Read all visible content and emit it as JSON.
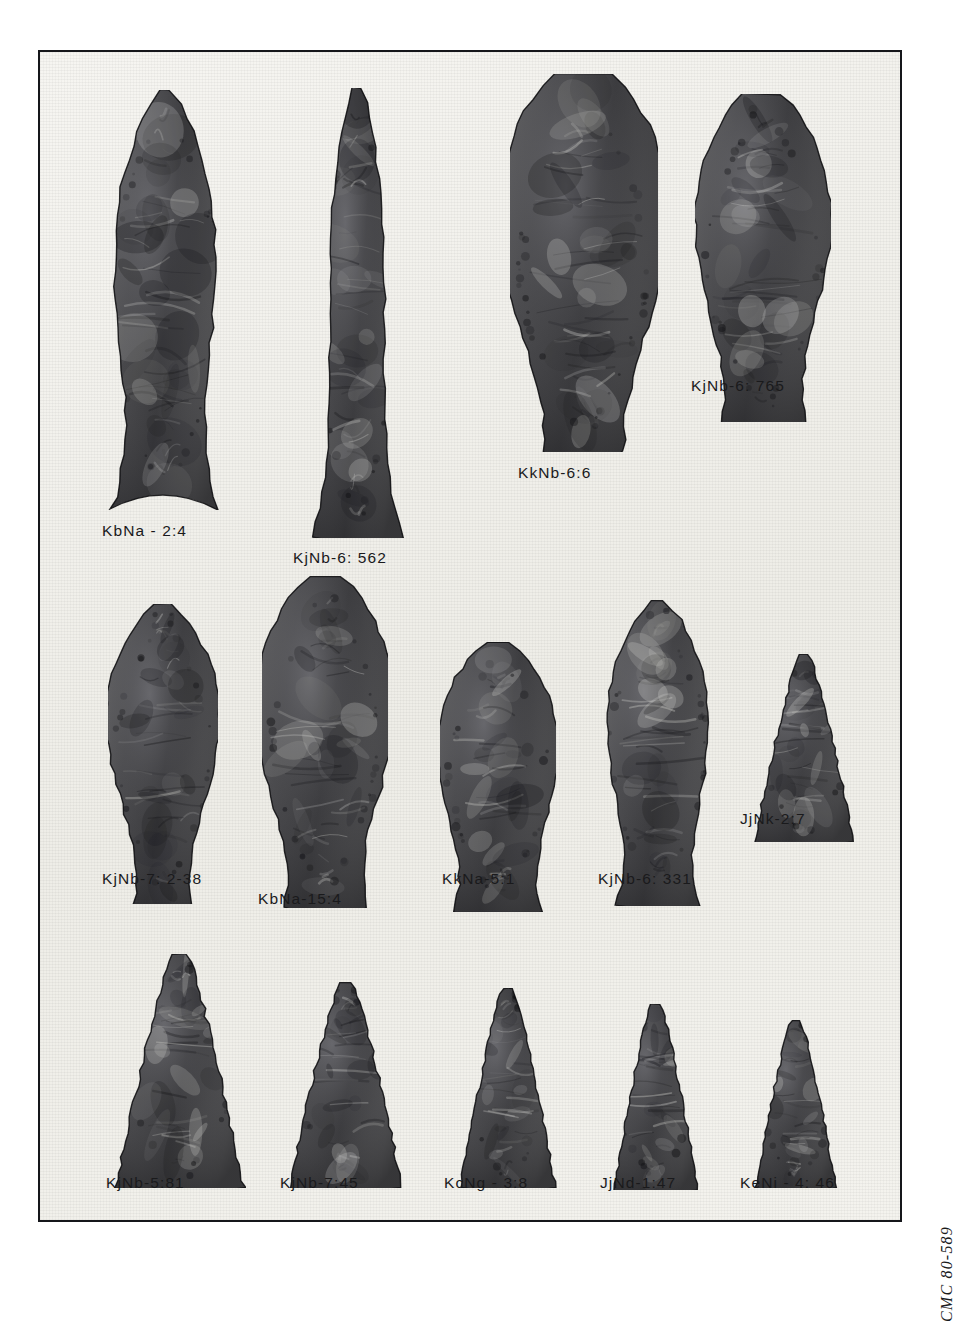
{
  "plate": {
    "archive_caption": "CMC 80-589",
    "background_color": "#f2f1ec",
    "frame_color": "#15161a",
    "stone_color": "#4a4a4c"
  },
  "rows": [
    {
      "row_label": "row-1",
      "specimens": [
        {
          "catalog": "KbNa - 2:4",
          "shape": "long-lanceolate-concave-base",
          "x": 58,
          "y": 38,
          "w": 134,
          "h": 420,
          "cap_x": 62,
          "cap_y": 470
        },
        {
          "catalog": "KjNb-6: 562",
          "shape": "narrow-parallel-lanceolate",
          "x": 268,
          "y": 36,
          "w": 98,
          "h": 450,
          "cap_x": 253,
          "cap_y": 497
        },
        {
          "catalog": "KkNb-6:6",
          "shape": "broad-ovoid-biface",
          "x": 470,
          "y": 22,
          "w": 148,
          "h": 378,
          "cap_x": 478,
          "cap_y": 412
        },
        {
          "catalog": "KjNb-6: 765",
          "shape": "ovate-rounded-base",
          "x": 655,
          "y": 42,
          "w": 136,
          "h": 328,
          "cap_x": 651,
          "cap_y": 325
        }
      ]
    },
    {
      "row_label": "row-2",
      "specimens": [
        {
          "catalog": "KjNb-7: 2-38",
          "shape": "leaf-biconvex",
          "x": 68,
          "y": 552,
          "w": 110,
          "h": 300,
          "cap_x": 62,
          "cap_y": 818
        },
        {
          "catalog": "KbNa-15:4",
          "shape": "broad-leaf-flat-base",
          "x": 222,
          "y": 524,
          "w": 126,
          "h": 332,
          "cap_x": 218,
          "cap_y": 838
        },
        {
          "catalog": "KkNa-5:1",
          "shape": "ovate-blunt-base",
          "x": 400,
          "y": 590,
          "w": 116,
          "h": 270,
          "cap_x": 402,
          "cap_y": 818
        },
        {
          "catalog": "KjNb-6: 331",
          "shape": "lanceolate-pointed",
          "x": 560,
          "y": 548,
          "w": 116,
          "h": 306,
          "cap_x": 558,
          "cap_y": 818
        },
        {
          "catalog": "JjNk-2:7",
          "shape": "small-triangular",
          "x": 712,
          "y": 602,
          "w": 104,
          "h": 188,
          "cap_x": 700,
          "cap_y": 758
        }
      ]
    },
    {
      "row_label": "row-3",
      "specimens": [
        {
          "catalog": "KjNb-5:81",
          "shape": "triangular-straight-base",
          "x": 74,
          "y": 902,
          "w": 132,
          "h": 234,
          "cap_x": 66,
          "cap_y": 1122
        },
        {
          "catalog": "KjNb-7:45",
          "shape": "triangular-straight-base",
          "x": 248,
          "y": 930,
          "w": 116,
          "h": 206,
          "cap_x": 240,
          "cap_y": 1122
        },
        {
          "catalog": "KcNg - 3:8",
          "shape": "triangular-narrow",
          "x": 418,
          "y": 936,
          "w": 100,
          "h": 200,
          "cap_x": 404,
          "cap_y": 1122
        },
        {
          "catalog": "JjNd-1:47",
          "shape": "triangular-narrow",
          "x": 572,
          "y": 952,
          "w": 88,
          "h": 186,
          "cap_x": 560,
          "cap_y": 1122
        },
        {
          "catalog": "KeNi - 4: 46",
          "shape": "triangular-small",
          "x": 714,
          "y": 968,
          "w": 84,
          "h": 168,
          "cap_x": 700,
          "cap_y": 1122
        }
      ]
    }
  ]
}
